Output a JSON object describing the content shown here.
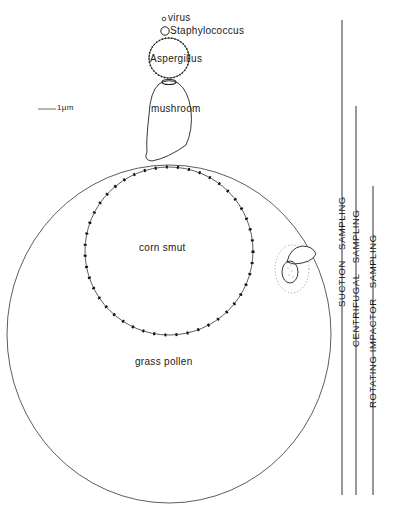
{
  "diagram": {
    "scale_bar": {
      "label": "1µm"
    },
    "particles": [
      {
        "id": "virus",
        "label": "virus"
      },
      {
        "id": "staphylococcus",
        "label": "Staphylococcus"
      },
      {
        "id": "aspergillus",
        "label": "Aspergillus"
      },
      {
        "id": "mushroom",
        "label": "mushroom"
      },
      {
        "id": "corn_smut",
        "label": "corn smut"
      },
      {
        "id": "grass_pollen",
        "label": "grass pollen"
      }
    ],
    "sampling_methods": [
      {
        "id": "suction",
        "word1": "SUCTION",
        "word2": "SAMPLING"
      },
      {
        "id": "centrifugal",
        "word1": "CENTRIFUGAL",
        "word2": "SAMPLING"
      },
      {
        "id": "rotating_impactor",
        "word1": "ROTATING IMPACTOR",
        "word2": "SAMPLING"
      }
    ],
    "colors": {
      "ink": "#1a1a1a",
      "faint": "#9a9a9a",
      "background": "#ffffff"
    }
  }
}
